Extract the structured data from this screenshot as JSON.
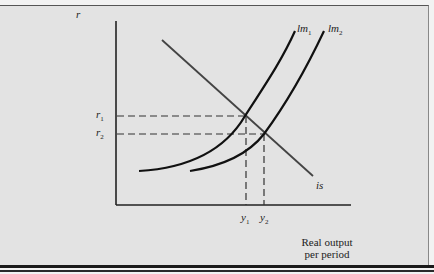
{
  "diagram": {
    "type": "IS-LM",
    "y_axis_label": "r",
    "x_axis_label_line1": "Real output",
    "x_axis_label_line2": "per period",
    "curves": {
      "lm1": {
        "name": "lm",
        "sub": "1"
      },
      "lm2": {
        "name": "lm",
        "sub": "2"
      },
      "is": {
        "name": "is"
      }
    },
    "levels": {
      "r1": {
        "name": "r",
        "sub": "1"
      },
      "r2": {
        "name": "r",
        "sub": "2"
      },
      "y1": {
        "name": "y",
        "sub": "1"
      },
      "y2": {
        "name": "y",
        "sub": "2"
      }
    },
    "colors": {
      "background": "#e3e3e3",
      "lm_curve": "#111111",
      "is_curve": "#444444",
      "axis": "#222222",
      "dash": "#333333"
    }
  }
}
